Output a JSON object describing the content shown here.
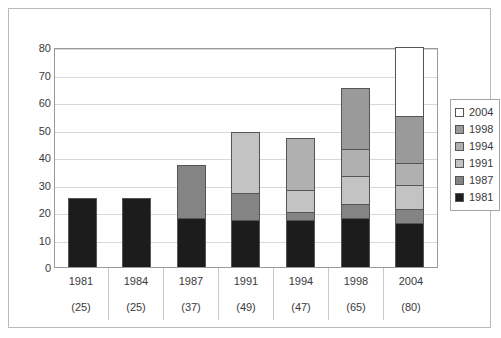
{
  "chart_data": {
    "type": "bar",
    "subtype": "stacked-bar",
    "title": "",
    "xlabel": "",
    "ylabel": "",
    "ylim": [
      0,
      80
    ],
    "ytick_step": 10,
    "yticks": [
      "80",
      "70",
      "60",
      "50",
      "40",
      "30",
      "20",
      "10",
      "0"
    ],
    "grid": true,
    "legend_position": "right",
    "categories": [
      "1981",
      "1984",
      "1987",
      "1991",
      "1994",
      "1998",
      "2004"
    ],
    "category_totals": [
      "(25)",
      "(25)",
      "(37)",
      "(49)",
      "(47)",
      "(65)",
      "(80)"
    ],
    "totals": [
      25,
      25,
      37,
      49,
      47,
      65,
      80
    ],
    "series": [
      {
        "name": "1981",
        "color": "#1c1c1c",
        "values": [
          25,
          25,
          18,
          17,
          17,
          18,
          16
        ]
      },
      {
        "name": "1987",
        "color": "#848484",
        "values": [
          0,
          0,
          19,
          10,
          3,
          5,
          5
        ]
      },
      {
        "name": "1991",
        "color": "#c3c3c3",
        "values": [
          0,
          0,
          0,
          22,
          8,
          10,
          9
        ]
      },
      {
        "name": "1994",
        "color": "#b0b0b0",
        "values": [
          0,
          0,
          0,
          0,
          19,
          10,
          8
        ]
      },
      {
        "name": "1998",
        "color": "#9a9a9a",
        "values": [
          0,
          0,
          0,
          0,
          0,
          22,
          17
        ]
      },
      {
        "name": "2004",
        "color": "#ffffff",
        "values": [
          0,
          0,
          0,
          0,
          0,
          0,
          25
        ]
      }
    ]
  },
  "legend": {
    "items": [
      {
        "label": "2004",
        "color": "#ffffff"
      },
      {
        "label": "1998",
        "color": "#9a9a9a"
      },
      {
        "label": "1994",
        "color": "#b0b0b0"
      },
      {
        "label": "1991",
        "color": "#c3c3c3"
      },
      {
        "label": "1987",
        "color": "#848484"
      },
      {
        "label": "1981",
        "color": "#1c1c1c"
      }
    ]
  }
}
